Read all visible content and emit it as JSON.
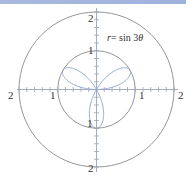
{
  "chart_data": {
    "type": "polar",
    "title": "",
    "equation_label": "r = sin 3θ",
    "equation_parts": {
      "lhs": "r",
      "eq": "=",
      "rhs": " sin 3",
      "theta": "θ"
    },
    "function": "r = sin(3*theta)",
    "theta_range": [
      0,
      3.14159
    ],
    "reference_circles": [
      1,
      2
    ],
    "axis_range": [
      -2,
      2
    ],
    "tick_step": 0.2,
    "axis_labels": {
      "x_neg2": "2",
      "x_neg1": "1",
      "x_pos1": "1",
      "x_pos2": "2",
      "y_pos2": "2",
      "y_pos1": "1",
      "y_neg1": "1",
      "y_neg2": "2"
    },
    "petals": 3,
    "petal_directions_deg": [
      30,
      150,
      270
    ]
  },
  "colors": {
    "curve": "#8ea6cf",
    "circles": "#8a8a8a",
    "axes": "#9aa4b8",
    "topbar": "#a9b9de"
  }
}
